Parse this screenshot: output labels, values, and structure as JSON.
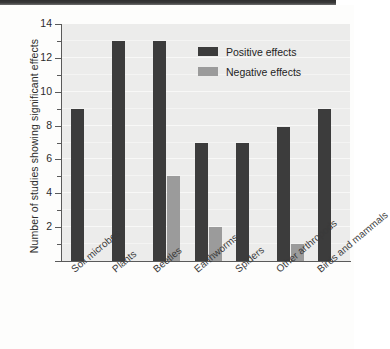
{
  "chart_data": {
    "type": "bar",
    "title": "",
    "xlabel": "",
    "ylabel": "Number of studies showing significant effects",
    "ylim": [
      0,
      14
    ],
    "yticks": [
      0,
      2,
      4,
      6,
      8,
      10,
      12,
      14
    ],
    "ytick_labels": [
      "",
      "2",
      "4",
      "6",
      "8",
      "10",
      "12",
      "14"
    ],
    "minor_ticks": [
      1,
      3,
      5,
      7,
      9,
      11,
      13
    ],
    "grid": true,
    "legend_position": "upper right",
    "categories": [
      "Soil microbes",
      "Plants",
      "Beetles",
      "Earthworms",
      "Spiders",
      "Other arthropods",
      "Birds and mammals"
    ],
    "series": [
      {
        "name": "Positive effects",
        "color": "#3c3c3c",
        "values": [
          9,
          13,
          13,
          7,
          7,
          7.9,
          9
        ]
      },
      {
        "name": "Negative effects",
        "color": "#9b9b9b",
        "values": [
          0,
          0,
          5,
          2,
          0,
          1,
          0
        ]
      }
    ]
  },
  "legend": {
    "items": [
      {
        "label": "Positive effects",
        "color": "#3c3c3c"
      },
      {
        "label": "Negative effects",
        "color": "#9b9b9b"
      }
    ]
  },
  "colors": {
    "positive": "#3c3c3c",
    "negative": "#9b9b9b",
    "plot_background": "#ececeb",
    "axis": "#5a5a5a",
    "text": "#2b2b2b"
  }
}
